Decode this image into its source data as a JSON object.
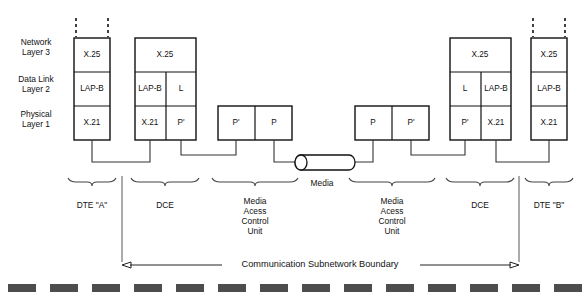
{
  "diagram": {
    "colors": {
      "stroke": "#111111",
      "wire": "#333333",
      "bottom_bar": "#4d4d4d",
      "background": "#ffffff"
    },
    "layer_labels": [
      {
        "id": "network",
        "line1": "Network",
        "line2": "Layer 3"
      },
      {
        "id": "datalink",
        "line1": "Data Link",
        "line2": "Layer 2"
      },
      {
        "id": "physical",
        "line1": "Physical",
        "line2": "Layer 1"
      }
    ],
    "stacks": [
      {
        "id": "dte-a",
        "caption": "DTE \"A\"",
        "has_top_dashes": true,
        "cells": {
          "network": [
            "X.25"
          ],
          "datalink": [
            "LAP-B"
          ],
          "physical": [
            "X.21"
          ]
        }
      },
      {
        "id": "dce-left",
        "caption": "DCE",
        "has_top_dashes": false,
        "cells": {
          "network": [
            "X.25"
          ],
          "datalink": [
            "LAP-B",
            "L"
          ],
          "physical": [
            "X.21",
            "P'"
          ]
        }
      },
      {
        "id": "mac-left",
        "caption_lines": [
          "Media",
          "Acess",
          "Control",
          "Unit"
        ],
        "has_top_dashes": false,
        "cells": {
          "physical": [
            "P'",
            "P"
          ]
        }
      },
      {
        "id": "mac-right",
        "caption_lines": [
          "Media",
          "Acess",
          "Control",
          "Unit"
        ],
        "has_top_dashes": false,
        "cells": {
          "physical": [
            "P",
            "P'"
          ]
        }
      },
      {
        "id": "dce-right",
        "caption": "DCE",
        "has_top_dashes": false,
        "cells": {
          "network": [
            "X.25"
          ],
          "datalink": [
            "L",
            "LAP-B"
          ],
          "physical": [
            "P'",
            "X.21"
          ]
        }
      },
      {
        "id": "dte-b",
        "caption": "DTE \"B\"",
        "has_top_dashes": true,
        "cells": {
          "network": [
            "X.25"
          ],
          "datalink": [
            "LAP-B"
          ],
          "physical": [
            "X.21"
          ]
        }
      }
    ],
    "media": {
      "label": "Media"
    },
    "boundary": {
      "label": "Communication Subnetwork Boundary"
    }
  }
}
